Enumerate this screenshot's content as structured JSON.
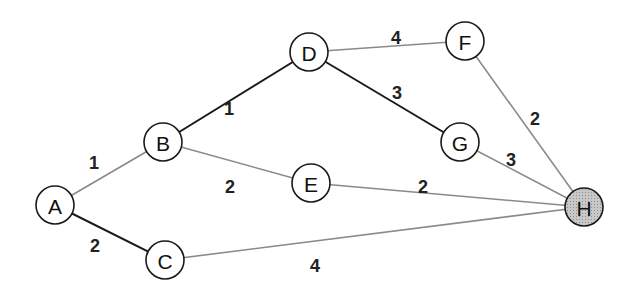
{
  "diagram": {
    "type": "weighted-undirected-graph",
    "nodes": [
      {
        "id": "A",
        "label": "A",
        "x": 55,
        "y": 205,
        "highlighted": false
      },
      {
        "id": "B",
        "label": "B",
        "x": 163,
        "y": 142,
        "highlighted": false
      },
      {
        "id": "C",
        "label": "C",
        "x": 165,
        "y": 260,
        "highlighted": false
      },
      {
        "id": "D",
        "label": "D",
        "x": 309,
        "y": 52,
        "highlighted": false
      },
      {
        "id": "E",
        "label": "E",
        "x": 311,
        "y": 183,
        "highlighted": false
      },
      {
        "id": "F",
        "label": "F",
        "x": 465,
        "y": 41,
        "highlighted": false
      },
      {
        "id": "G",
        "label": "G",
        "x": 460,
        "y": 142,
        "highlighted": false
      },
      {
        "id": "H",
        "label": "H",
        "x": 584,
        "y": 207,
        "highlighted": true
      }
    ],
    "edges": [
      {
        "from": "A",
        "to": "B",
        "weight": "1",
        "style": "gray",
        "lx": 94,
        "ly": 163
      },
      {
        "from": "A",
        "to": "C",
        "weight": "2",
        "style": "dark",
        "lx": 95,
        "ly": 246
      },
      {
        "from": "B",
        "to": "D",
        "weight": "1",
        "style": "dark",
        "lx": 229,
        "ly": 109
      },
      {
        "from": "B",
        "to": "E",
        "weight": "2",
        "style": "gray",
        "lx": 230,
        "ly": 187
      },
      {
        "from": "D",
        "to": "F",
        "weight": "4",
        "style": "gray",
        "lx": 396,
        "ly": 38
      },
      {
        "from": "D",
        "to": "G",
        "weight": "3",
        "style": "dark",
        "lx": 397,
        "ly": 93
      },
      {
        "from": "F",
        "to": "H",
        "weight": "2",
        "style": "gray",
        "lx": 535,
        "ly": 119
      },
      {
        "from": "G",
        "to": "H",
        "weight": "3",
        "style": "gray",
        "lx": 511,
        "ly": 160
      },
      {
        "from": "E",
        "to": "H",
        "weight": "2",
        "style": "gray",
        "lx": 423,
        "ly": 187
      },
      {
        "from": "C",
        "to": "H",
        "weight": "4",
        "style": "gray",
        "lx": 315,
        "ly": 266
      }
    ],
    "colors": {
      "dark_edge": "#1a1a1a",
      "gray_edge": "#8a8a8a",
      "node_stroke": "#1a1a1a",
      "node_fill": "#ffffff",
      "highlight_fill": "#bdbdbd"
    }
  }
}
